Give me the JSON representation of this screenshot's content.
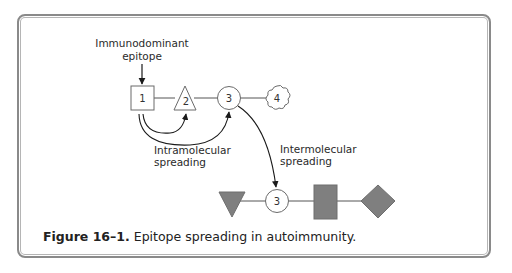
{
  "figure": {
    "caption_label": "Figure 16–1.",
    "caption_text": "Epitope spreading in autoimmunity.",
    "labels": {
      "immunodominant_line1": "Immunodominant",
      "immunodominant_line2": "epitope",
      "intramolecular_line1": "Intramolecular",
      "intramolecular_line2": "spreading",
      "intermolecular_line1": "Intermolecular",
      "intermolecular_line2": "spreading"
    },
    "top_row_epitopes": [
      {
        "id": "1",
        "shape": "square"
      },
      {
        "id": "2",
        "shape": "triangle"
      },
      {
        "id": "3",
        "shape": "circle"
      },
      {
        "id": "4",
        "shape": "cloud"
      }
    ],
    "bottom_row_epitopes": [
      {
        "id": "",
        "shape": "inverted-triangle-filled"
      },
      {
        "id": "3",
        "shape": "circle"
      },
      {
        "id": "",
        "shape": "rectangle-filled"
      },
      {
        "id": "",
        "shape": "diamond-filled"
      }
    ],
    "colors": {
      "frame": "#8a8a8a",
      "filled_shape": "#7f7f7f",
      "outline_shape": "#6a6a6a",
      "arrow": "#1a1a1a"
    }
  }
}
